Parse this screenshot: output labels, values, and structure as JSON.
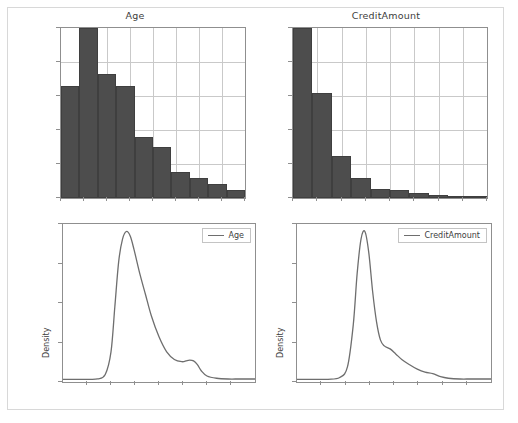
{
  "figure": {
    "width": 518,
    "height": 423,
    "background": "#ffffff",
    "frame_color": "#d8d8d8"
  },
  "colors": {
    "bar_fill": "#4d4d4d",
    "bar_edge": "#3f3f3f",
    "curve": "#6e6e6e",
    "grid": "#c9c9c9",
    "axis": "#8f8f8f",
    "text": "#3d3d3d"
  },
  "panels": {
    "hist_age": {
      "title": "Age"
    },
    "hist_credit": {
      "title": "CreditAmount"
    },
    "kde_age": {
      "ylabel": "Density",
      "legend": "Age"
    },
    "kde_credit": {
      "ylabel": "Density",
      "legend": "CreditAmount"
    }
  },
  "chart_data": [
    {
      "type": "bar",
      "id": "hist-age",
      "title": "Age",
      "xlabel": "",
      "ylabel": "",
      "grid": true,
      "legend": null,
      "xlim": [
        0,
        10
      ],
      "ylim": [
        0,
        1.0
      ],
      "categories": [
        "b1",
        "b2",
        "b3",
        "b4",
        "b5",
        "b6",
        "b7",
        "b8",
        "b9",
        "b10"
      ],
      "values": [
        0.66,
        1.0,
        0.73,
        0.66,
        0.36,
        0.3,
        0.155,
        0.115,
        0.085,
        0.045
      ],
      "xticks": [
        0,
        1.25,
        2.5,
        3.75,
        5.0,
        6.25,
        7.5,
        8.75,
        10
      ],
      "yticks": [
        0,
        0.2,
        0.4,
        0.6,
        0.8,
        1.0
      ]
    },
    {
      "type": "bar",
      "id": "hist-credit",
      "title": "CreditAmount",
      "xlabel": "",
      "ylabel": "",
      "grid": true,
      "legend": null,
      "xlim": [
        0,
        10
      ],
      "ylim": [
        0,
        1.0
      ],
      "categories": [
        "b1",
        "b2",
        "b3",
        "b4",
        "b5",
        "b6",
        "b7",
        "b8",
        "b9",
        "b10"
      ],
      "values": [
        1.0,
        0.62,
        0.25,
        0.115,
        0.055,
        0.045,
        0.03,
        0.018,
        0.012,
        0.008
      ],
      "xticks": [
        0,
        1.25,
        2.5,
        3.75,
        5.0,
        6.25,
        7.5,
        8.75,
        10
      ],
      "yticks": [
        0,
        0.2,
        0.4,
        0.6,
        0.8,
        1.0
      ]
    },
    {
      "type": "line",
      "id": "kde-age",
      "title": "",
      "xlabel": "",
      "ylabel": "Density",
      "grid": false,
      "legend": "Age",
      "legend_position": "upper right",
      "xlim": [
        0,
        100
      ],
      "ylim": [
        0,
        1.05
      ],
      "series": [
        {
          "name": "Age",
          "x": [
            0,
            6,
            12,
            18,
            22,
            25,
            27,
            29,
            31,
            33,
            35,
            37,
            40,
            43,
            46,
            50,
            54,
            58,
            62,
            64,
            66,
            68,
            70,
            72,
            75,
            80,
            86,
            92,
            100
          ],
          "y": [
            0.018,
            0.018,
            0.018,
            0.02,
            0.05,
            0.2,
            0.5,
            0.8,
            0.95,
            1.0,
            0.97,
            0.88,
            0.72,
            0.58,
            0.44,
            0.3,
            0.2,
            0.15,
            0.135,
            0.14,
            0.145,
            0.14,
            0.115,
            0.075,
            0.04,
            0.025,
            0.02,
            0.02,
            0.02
          ]
        }
      ]
    },
    {
      "type": "line",
      "id": "kde-credit",
      "title": "",
      "xlabel": "",
      "ylabel": "Density",
      "grid": false,
      "legend": "CreditAmount",
      "legend_position": "upper right",
      "xlim": [
        0,
        100
      ],
      "ylim": [
        0,
        1.05
      ],
      "series": [
        {
          "name": "CreditAmount",
          "x": [
            0,
            8,
            16,
            22,
            26,
            29,
            31,
            33,
            35,
            37,
            39,
            41,
            43,
            45,
            48,
            51,
            54,
            58,
            62,
            66,
            70,
            74,
            78,
            84,
            90,
            100
          ],
          "y": [
            0.018,
            0.018,
            0.018,
            0.03,
            0.1,
            0.38,
            0.72,
            0.95,
            1.0,
            0.86,
            0.6,
            0.4,
            0.28,
            0.24,
            0.22,
            0.185,
            0.15,
            0.115,
            0.085,
            0.065,
            0.055,
            0.035,
            0.025,
            0.02,
            0.02,
            0.02
          ]
        }
      ]
    }
  ]
}
